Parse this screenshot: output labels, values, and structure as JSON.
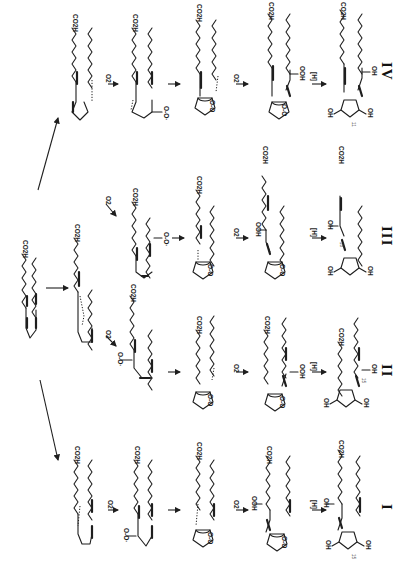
{
  "figure": {
    "orientation": "rotated-90-clockwise",
    "starting_material": {
      "label": "CO2H",
      "name": "arachidonic acid"
    }
  },
  "reagents": {
    "oxygen": "O2",
    "reduction": "[H]"
  },
  "groups": {
    "acid": "CO2H",
    "peroxyl": "O-O·",
    "hydroperoxide": "OOH",
    "hydroxyl": "OH",
    "endoperoxide": "O-O",
    "stereo_mark": "11"
  },
  "series": [
    {
      "id": "IV",
      "label": "IV",
      "steps": [
        "radical",
        "peroxyl radical",
        "endoperoxide radical",
        "endoperoxide hydroperoxide",
        "isoprostane"
      ]
    },
    {
      "id": "III",
      "label": "III",
      "steps": [
        "peroxyl radical",
        "endoperoxide radical",
        "endoperoxide hydroperoxide",
        "isoprostane"
      ]
    },
    {
      "id": "II",
      "label": "II",
      "steps": [
        "peroxyl radical",
        "endoperoxide radical",
        "endoperoxide hydroperoxide",
        "isoprostane"
      ]
    },
    {
      "id": "I",
      "label": "I",
      "steps": [
        "radical",
        "peroxyl radical",
        "endoperoxide radical",
        "endoperoxide hydroperoxide",
        "isoprostane"
      ]
    }
  ],
  "stereo_labels": {
    "iv": "11",
    "iii": "18",
    "ii": "15",
    "i": "15"
  }
}
